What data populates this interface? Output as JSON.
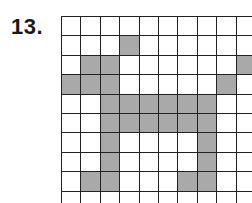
{
  "problem": {
    "number_label": "13."
  },
  "grid": {
    "columns": 10,
    "rows": 10,
    "shade_color": "#a9a9a9",
    "line_color": "#222222",
    "cells": [
      [
        0,
        0,
        0,
        0,
        0,
        0,
        0,
        0,
        0,
        0
      ],
      [
        0,
        0,
        0,
        1,
        0,
        0,
        0,
        0,
        0,
        0
      ],
      [
        0,
        1,
        1,
        0,
        0,
        0,
        0,
        0,
        0,
        1
      ],
      [
        1,
        1,
        1,
        0,
        0,
        0,
        0,
        0,
        1,
        0
      ],
      [
        0,
        0,
        1,
        1,
        1,
        1,
        1,
        1,
        0,
        0
      ],
      [
        0,
        0,
        1,
        1,
        1,
        1,
        1,
        1,
        0,
        0
      ],
      [
        0,
        0,
        1,
        0,
        0,
        0,
        0,
        1,
        0,
        0
      ],
      [
        0,
        0,
        1,
        0,
        0,
        0,
        0,
        1,
        0,
        0
      ],
      [
        0,
        1,
        1,
        0,
        0,
        0,
        1,
        1,
        0,
        0
      ],
      [
        0,
        0,
        0,
        0,
        0,
        0,
        0,
        0,
        0,
        0
      ]
    ]
  }
}
